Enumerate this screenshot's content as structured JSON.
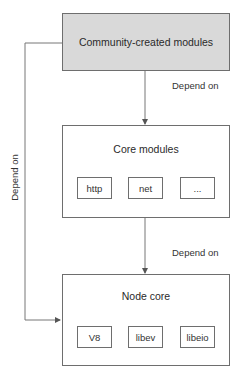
{
  "diagram": {
    "top": {
      "label": "Community-created modules",
      "fill": "#d9d9d9"
    },
    "core_modules": {
      "title": "Core modules",
      "items": [
        "http",
        "net",
        "..."
      ]
    },
    "node_core": {
      "title": "Node core",
      "items": [
        "V8",
        "libev",
        "libeio"
      ]
    },
    "edges": [
      {
        "from": "Community-created modules",
        "to": "Core modules",
        "label": "Depend on"
      },
      {
        "from": "Core modules",
        "to": "Node core",
        "label": "Depend on"
      },
      {
        "from": "Community-created modules",
        "to": "Node core",
        "label": "Depend on"
      }
    ],
    "line_color": "#6e6e6e"
  }
}
